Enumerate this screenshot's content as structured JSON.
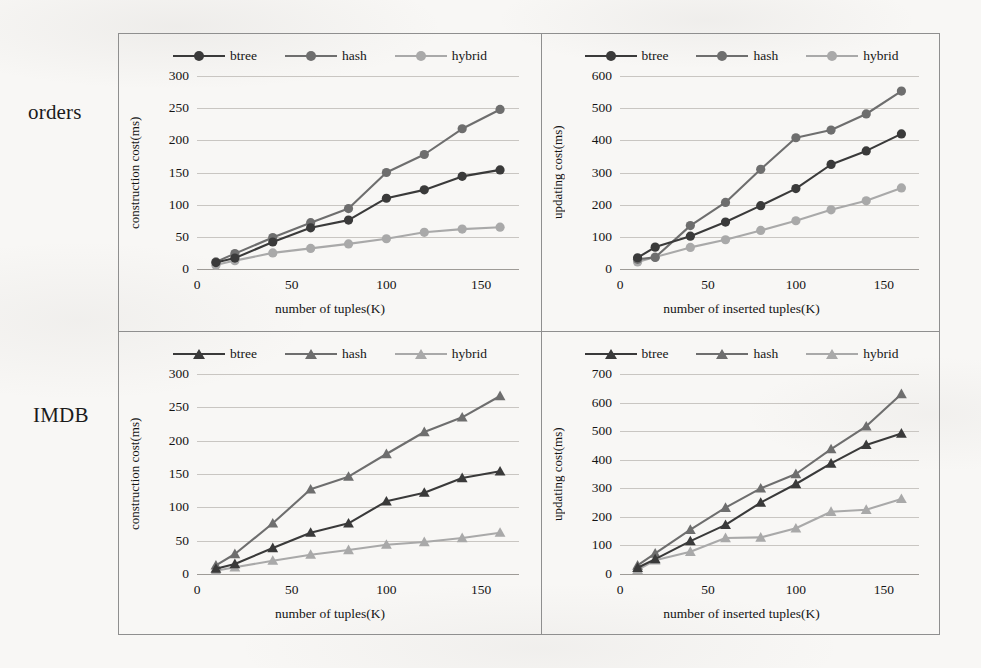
{
  "figure": {
    "rows": [
      {
        "id": "orders",
        "label": "orders"
      },
      {
        "id": "imdb",
        "label": "IMDB"
      }
    ],
    "colors": {
      "btree": "#3a3a3a",
      "hash": "#6e6e6e",
      "hybrid": "#a9a9a9",
      "gridline": "#c9c6c2",
      "axis": "#9e9b97",
      "frame": "#8f8f8f",
      "text": "#141414",
      "background": "#f8f7f5"
    },
    "series_names": [
      "btree",
      "hash",
      "hybrid"
    ]
  },
  "chart_data": [
    {
      "id": "orders-construction",
      "row": "orders",
      "type": "line",
      "title": "",
      "marker": "circle",
      "xlabel": "number of tuples(K)",
      "ylabel": "construction cost(ms)",
      "x": [
        10,
        20,
        40,
        60,
        80,
        100,
        120,
        140,
        160
      ],
      "xticks": [
        0,
        50,
        100,
        150
      ],
      "xlim": [
        0,
        170
      ],
      "yticks": [
        0,
        50,
        100,
        150,
        200,
        250,
        300
      ],
      "ylim": [
        0,
        300
      ],
      "legend": [
        "btree",
        "hash",
        "hybrid"
      ],
      "legend_position": "top",
      "grid": true,
      "series": [
        {
          "name": "btree",
          "values": [
            10,
            17,
            42,
            64,
            76,
            110,
            123,
            144,
            154
          ]
        },
        {
          "name": "hash",
          "values": [
            11,
            24,
            49,
            72,
            94,
            150,
            178,
            218,
            248
          ]
        },
        {
          "name": "hybrid",
          "values": [
            6,
            13,
            25,
            32,
            39,
            47,
            57,
            62,
            65
          ]
        }
      ]
    },
    {
      "id": "orders-updating",
      "row": "orders",
      "type": "line",
      "title": "",
      "marker": "circle",
      "xlabel": "number of inserted tuples(K)",
      "ylabel": "updating cost(ms)",
      "x": [
        10,
        20,
        40,
        60,
        80,
        100,
        120,
        140,
        160
      ],
      "xticks": [
        0,
        50,
        100,
        150
      ],
      "xlim": [
        0,
        170
      ],
      "yticks": [
        0,
        100,
        200,
        300,
        400,
        500,
        600
      ],
      "ylim": [
        0,
        600
      ],
      "legend": [
        "btree",
        "hash",
        "hybrid"
      ],
      "legend_position": "top",
      "grid": true,
      "series": [
        {
          "name": "btree",
          "values": [
            35,
            68,
            102,
            146,
            197,
            250,
            325,
            367,
            420
          ]
        },
        {
          "name": "hash",
          "values": [
            30,
            36,
            135,
            207,
            310,
            408,
            432,
            482,
            553
          ]
        },
        {
          "name": "hybrid",
          "values": [
            22,
            37,
            67,
            91,
            120,
            150,
            184,
            212,
            252
          ]
        }
      ]
    },
    {
      "id": "imdb-construction",
      "row": "imdb",
      "type": "line",
      "title": "",
      "marker": "triangle",
      "xlabel": "number of tuples(K)",
      "ylabel": "construction cost(ms)",
      "x": [
        10,
        20,
        40,
        60,
        80,
        100,
        120,
        140,
        160
      ],
      "xticks": [
        0,
        50,
        100,
        150
      ],
      "xlim": [
        0,
        170
      ],
      "yticks": [
        0,
        50,
        100,
        150,
        200,
        250,
        300
      ],
      "ylim": [
        0,
        300
      ],
      "legend": [
        "btree",
        "hash",
        "hybrid"
      ],
      "legend_position": "top",
      "grid": true,
      "series": [
        {
          "name": "btree",
          "values": [
            8,
            15,
            39,
            62,
            76,
            109,
            122,
            144,
            154
          ]
        },
        {
          "name": "hash",
          "values": [
            13,
            30,
            76,
            127,
            146,
            180,
            213,
            235,
            267
          ]
        },
        {
          "name": "hybrid",
          "values": [
            5,
            10,
            20,
            29,
            36,
            44,
            48,
            54,
            62
          ]
        }
      ]
    },
    {
      "id": "imdb-updating",
      "row": "imdb",
      "type": "line",
      "title": "",
      "marker": "triangle",
      "xlabel": "number of inserted tuples(K)",
      "ylabel": "updating cost(ms)",
      "x": [
        10,
        20,
        40,
        60,
        80,
        100,
        120,
        140,
        160
      ],
      "xticks": [
        0,
        50,
        100,
        150
      ],
      "xlim": [
        0,
        170
      ],
      "yticks": [
        0,
        100,
        200,
        300,
        400,
        500,
        600,
        700
      ],
      "ylim": [
        0,
        700
      ],
      "legend": [
        "btree",
        "hash",
        "hybrid"
      ],
      "legend_position": "top",
      "grid": true,
      "series": [
        {
          "name": "btree",
          "values": [
            22,
            52,
            115,
            172,
            250,
            315,
            387,
            452,
            492
          ]
        },
        {
          "name": "hash",
          "values": [
            30,
            72,
            155,
            232,
            300,
            350,
            437,
            517,
            630
          ]
        },
        {
          "name": "hybrid",
          "values": [
            15,
            48,
            78,
            126,
            128,
            160,
            218,
            225,
            263
          ]
        }
      ]
    }
  ]
}
